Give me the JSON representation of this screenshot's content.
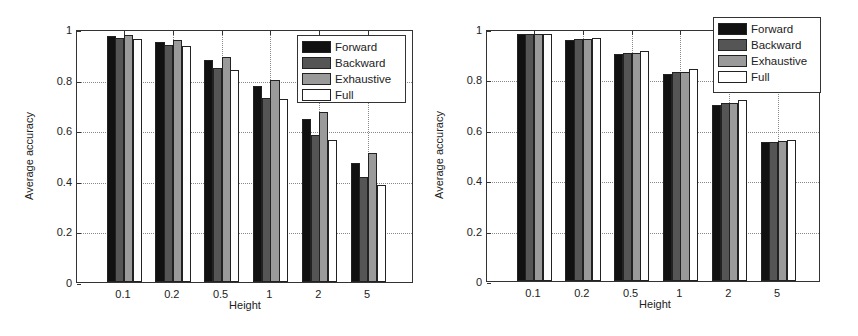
{
  "chart_data": [
    {
      "type": "bar",
      "title": "",
      "xlabel": "Height",
      "ylabel": "Average accuracy",
      "ylim": [
        0,
        1
      ],
      "yticks": [
        "0",
        "0.2",
        "0.4",
        "0.6",
        "0.8",
        "1"
      ],
      "grid": true,
      "legend_position": "upper right",
      "categories": [
        "0.1",
        "0.2",
        "0.5",
        "1",
        "2",
        "5"
      ],
      "series": [
        {
          "name": "Forward",
          "color": "#111111",
          "values": [
            0.972,
            0.948,
            0.877,
            0.774,
            0.643,
            0.472
          ]
        },
        {
          "name": "Backward",
          "color": "#555555",
          "values": [
            0.964,
            0.937,
            0.845,
            0.729,
            0.583,
            0.417
          ]
        },
        {
          "name": "Exhaustive",
          "color": "#9a9a9a",
          "values": [
            0.976,
            0.956,
            0.89,
            0.8,
            0.673,
            0.509
          ]
        },
        {
          "name": "Full",
          "color": "#ffffff",
          "values": [
            0.962,
            0.932,
            0.837,
            0.722,
            0.56,
            0.385
          ]
        }
      ]
    },
    {
      "type": "bar",
      "title": "",
      "xlabel": "Height",
      "ylabel": "Average accuracy",
      "ylim": [
        0,
        1
      ],
      "yticks": [
        "0",
        "0.2",
        "0.4",
        "0.6",
        "0.8",
        "1"
      ],
      "grid": true,
      "legend_position": "upper right",
      "categories": [
        "0.1",
        "0.2",
        "0.5",
        "1",
        "2",
        "5"
      ],
      "series": [
        {
          "name": "Forward",
          "color": "#111111",
          "values": [
            0.979,
            0.958,
            0.9,
            0.82,
            0.7,
            0.55
          ]
        },
        {
          "name": "Backward",
          "color": "#555555",
          "values": [
            0.979,
            0.96,
            0.906,
            0.83,
            0.705,
            0.553
          ]
        },
        {
          "name": "Exhaustive",
          "color": "#9a9a9a",
          "values": [
            0.98,
            0.96,
            0.906,
            0.83,
            0.705,
            0.554
          ]
        },
        {
          "name": "Full",
          "color": "#ffffff",
          "values": [
            0.979,
            0.965,
            0.913,
            0.84,
            0.72,
            0.56
          ]
        }
      ]
    }
  ]
}
